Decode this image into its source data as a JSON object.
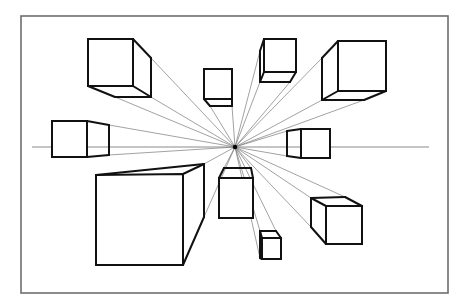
{
  "diagram": {
    "frame": {
      "x": 21,
      "y": 16,
      "w": 427,
      "h": 277,
      "stroke": "#6e6e6e"
    },
    "horizon": {
      "y": 147,
      "x1": 32,
      "x2": 429,
      "stroke": "#8a8a8a"
    },
    "vanishing_point": {
      "x": 235,
      "y": 147
    },
    "stroke_color": "#111111",
    "guide_color": "#7a7a7a",
    "boxes": [
      {
        "name": "box-top-left",
        "front": [
          [
            88,
            39
          ],
          [
            133,
            39
          ],
          [
            133,
            86
          ],
          [
            88,
            86
          ]
        ],
        "edges": [
          [
            [
              133,
              39
            ],
            [
              151,
              58
            ]
          ],
          [
            [
              151,
              58
            ],
            [
              151,
              97
            ]
          ],
          [
            [
              133,
              86
            ],
            [
              151,
              97
            ]
          ],
          [
            [
              88,
              86
            ],
            [
              115,
              97
            ]
          ],
          [
            [
              115,
              97
            ],
            [
              151,
              97
            ]
          ]
        ],
        "guides": [
          [
            151,
            58
          ],
          [
            151,
            97
          ],
          [
            115,
            97
          ]
        ]
      },
      {
        "name": "box-small-top-center",
        "front": [
          [
            204,
            69
          ],
          [
            232,
            69
          ],
          [
            232,
            99
          ],
          [
            204,
            99
          ]
        ],
        "edges": [
          [
            [
              204,
              99
            ],
            [
              210,
              106
            ]
          ],
          [
            [
              210,
              106
            ],
            [
              232,
              106
            ]
          ],
          [
            [
              232,
              99
            ],
            [
              232,
              106
            ]
          ]
        ],
        "guides": [
          [
            210,
            106
          ],
          [
            232,
            106
          ]
        ]
      },
      {
        "name": "box-top-center-right",
        "front": [
          [
            264,
            39
          ],
          [
            296,
            39
          ],
          [
            296,
            72
          ],
          [
            264,
            72
          ]
        ],
        "edges": [
          [
            [
              264,
              39
            ],
            [
              260,
              51
            ]
          ],
          [
            [
              260,
              51
            ],
            [
              260,
              82
            ]
          ],
          [
            [
              264,
              72
            ],
            [
              260,
              82
            ]
          ],
          [
            [
              260,
              82
            ],
            [
              290,
              82
            ]
          ],
          [
            [
              290,
              82
            ],
            [
              296,
              72
            ]
          ]
        ],
        "guides": [
          [
            260,
            51
          ],
          [
            260,
            82
          ],
          [
            290,
            82
          ]
        ]
      },
      {
        "name": "box-top-right",
        "front": [
          [
            338,
            41
          ],
          [
            386,
            41
          ],
          [
            386,
            91
          ],
          [
            338,
            91
          ]
        ],
        "edges": [
          [
            [
              338,
              41
            ],
            [
              322,
              58
            ]
          ],
          [
            [
              322,
              58
            ],
            [
              322,
              100
            ]
          ],
          [
            [
              338,
              91
            ],
            [
              322,
              100
            ]
          ],
          [
            [
              322,
              100
            ],
            [
              364,
              100
            ]
          ],
          [
            [
              364,
              100
            ],
            [
              386,
              91
            ]
          ]
        ],
        "guides": [
          [
            322,
            58
          ],
          [
            322,
            100
          ],
          [
            364,
            100
          ]
        ]
      },
      {
        "name": "box-left-mid",
        "front": [
          [
            52,
            121
          ],
          [
            87,
            121
          ],
          [
            87,
            157
          ],
          [
            52,
            157
          ]
        ],
        "edges": [
          [
            [
              87,
              121
            ],
            [
              109,
              125
            ]
          ],
          [
            [
              109,
              125
            ],
            [
              109,
              155
            ]
          ],
          [
            [
              87,
              157
            ],
            [
              109,
              155
            ]
          ]
        ],
        "guides": [
          [
            109,
            125
          ],
          [
            109,
            155
          ]
        ]
      },
      {
        "name": "box-right-mid",
        "front": [
          [
            301,
            129
          ],
          [
            330,
            129
          ],
          [
            330,
            158
          ],
          [
            301,
            158
          ]
        ],
        "edges": [
          [
            [
              301,
              129
            ],
            [
              287,
              131
            ]
          ],
          [
            [
              287,
              131
            ],
            [
              287,
              156
            ]
          ],
          [
            [
              301,
              158
            ],
            [
              287,
              156
            ]
          ]
        ],
        "guides": [
          [
            287,
            131
          ],
          [
            287,
            156
          ]
        ]
      },
      {
        "name": "box-bottom-left-large",
        "front": [
          [
            96,
            175
          ],
          [
            183,
            174
          ],
          [
            183,
            265
          ],
          [
            96,
            265
          ]
        ],
        "edges": [
          [
            [
              96,
              175
            ],
            [
              204,
              164
            ]
          ],
          [
            [
              183,
              174
            ],
            [
              204,
              164
            ]
          ],
          [
            [
              204,
              164
            ],
            [
              204,
              217
            ]
          ],
          [
            [
              204,
              217
            ],
            [
              183,
              265
            ]
          ]
        ],
        "guides": [
          [
            204,
            164
          ],
          [
            204,
            217
          ]
        ]
      },
      {
        "name": "box-center-bottom",
        "front": [
          [
            219,
            178
          ],
          [
            253,
            178
          ],
          [
            253,
            218
          ],
          [
            219,
            218
          ]
        ],
        "edges": [
          [
            [
              219,
              178
            ],
            [
              224,
              168
            ]
          ],
          [
            [
              224,
              168
            ],
            [
              251,
              168
            ]
          ],
          [
            [
              251,
              168
            ],
            [
              253,
              178
            ]
          ]
        ],
        "guides": [
          [
            224,
            168
          ],
          [
            251,
            168
          ]
        ]
      },
      {
        "name": "box-bottom-right",
        "front": [
          [
            326,
            206
          ],
          [
            362,
            206
          ],
          [
            362,
            244
          ],
          [
            326,
            244
          ]
        ],
        "edges": [
          [
            [
              326,
              206
            ],
            [
              311,
              198
            ]
          ],
          [
            [
              311,
              198
            ],
            [
              311,
              227
            ]
          ],
          [
            [
              311,
              227
            ],
            [
              326,
              244
            ]
          ],
          [
            [
              311,
              198
            ],
            [
              345,
              197
            ]
          ],
          [
            [
              345,
              197
            ],
            [
              362,
              206
            ]
          ]
        ],
        "guides": [
          [
            311,
            198
          ],
          [
            311,
            227
          ],
          [
            345,
            197
          ]
        ]
      },
      {
        "name": "box-bottom-small",
        "front": [
          [
            262,
            238
          ],
          [
            281,
            238
          ],
          [
            281,
            259
          ],
          [
            262,
            259
          ]
        ],
        "edges": [
          [
            [
              262,
              238
            ],
            [
              260,
              231
            ]
          ],
          [
            [
              260,
              231
            ],
            [
              276,
              231
            ]
          ],
          [
            [
              276,
              231
            ],
            [
              281,
              238
            ]
          ],
          [
            [
              260,
              231
            ],
            [
              260,
              258
            ]
          ],
          [
            [
              260,
              258
            ],
            [
              262,
              259
            ]
          ]
        ],
        "guides": [
          [
            260,
            231
          ],
          [
            276,
            231
          ],
          [
            260,
            258
          ]
        ]
      }
    ]
  }
}
